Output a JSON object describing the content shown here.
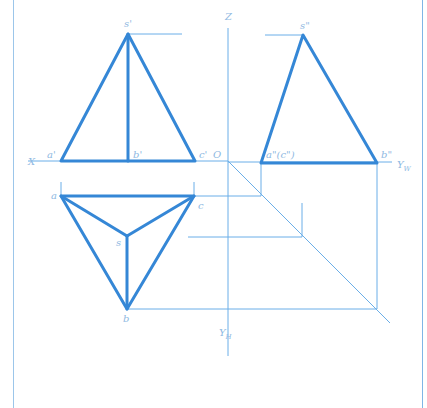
{
  "caption": "————",
  "colors": {
    "object_line": "#3587d6",
    "construction_line": "#6aaee8",
    "label": "#8fb9e2",
    "frame": "#9cc6ea"
  },
  "axes": {
    "x_label": "X",
    "z_label": "Z",
    "origin_label": "O",
    "yw_label": "Y",
    "yw_sub": "W",
    "yh_label": "Y",
    "yh_sub": "H"
  },
  "front_view": {
    "apex": "s'",
    "a": "a'",
    "b": "b'",
    "c": "c'"
  },
  "side_view": {
    "apex": "s\"",
    "ac": "a\"(c\")",
    "b": "b\""
  },
  "top_view": {
    "apex": "s",
    "a": "a",
    "b": "b",
    "c": "c"
  }
}
